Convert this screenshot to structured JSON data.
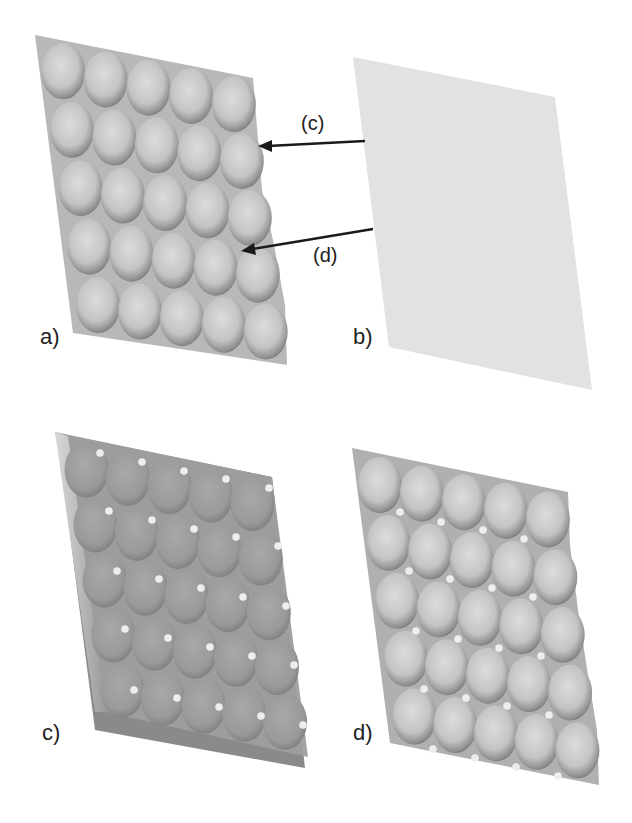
{
  "figure": {
    "panels": [
      {
        "id": "a",
        "label": "a)",
        "description": "3D textured surface with 5x5 array of bumps"
      },
      {
        "id": "b",
        "label": "b)",
        "description": "flat plane"
      },
      {
        "id": "c",
        "label": "c)",
        "description": "bumpy surface with flat plane overlay and marker dots"
      },
      {
        "id": "d",
        "label": "d)",
        "description": "bumpy surface with marker dots at bump junctions"
      }
    ],
    "annotations": [
      {
        "id": "c",
        "label": "(c)"
      },
      {
        "id": "d",
        "label": "(d)"
      }
    ],
    "colors": {
      "surface_light": "#d4d4d4",
      "surface_shadow": "#5a5a5a",
      "plane": "#e2e2e2",
      "overlay_plane": "#9c9c9c",
      "dot": "#eeeeee",
      "arrow": "#1a1a1a"
    }
  }
}
